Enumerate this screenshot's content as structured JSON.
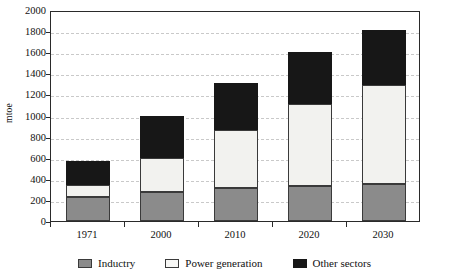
{
  "chart_data": {
    "type": "bar",
    "stacked": true,
    "title": "",
    "xlabel": "",
    "ylabel": "mtoe",
    "ylim": [
      0,
      2000
    ],
    "ytick_step": 200,
    "yticks": [
      0,
      200,
      400,
      600,
      800,
      1000,
      1200,
      1400,
      1600,
      1800,
      2000
    ],
    "grid": true,
    "grid_axis": "y",
    "legend_position": "bottom",
    "categories": [
      "1971",
      "2000",
      "2010",
      "2020",
      "2030"
    ],
    "series": [
      {
        "name": "Inductry",
        "color": "#8b8b8b",
        "values": [
          230,
          275,
          310,
          330,
          350
        ]
      },
      {
        "name": "Power generation",
        "color": "#f2f2ef",
        "values": [
          110,
          325,
          550,
          780,
          940
        ]
      },
      {
        "name": "Other sectors",
        "color": "#171717",
        "values": [
          225,
          400,
          450,
          490,
          520
        ]
      }
    ],
    "totals": [
      565,
      1000,
      1310,
      1600,
      1810
    ],
    "cumulative_tops": [
      [
        230,
        340,
        565
      ],
      [
        275,
        600,
        1000
      ],
      [
        310,
        860,
        1310
      ],
      [
        330,
        1110,
        1600
      ],
      [
        350,
        1290,
        1810
      ]
    ]
  },
  "legend": {
    "items": [
      {
        "label": "Inductry",
        "swatch": "industry-swatch"
      },
      {
        "label": "Power generation",
        "swatch": "power-generation-swatch"
      },
      {
        "label": "Other sectors",
        "swatch": "other-sectors-swatch"
      }
    ]
  }
}
